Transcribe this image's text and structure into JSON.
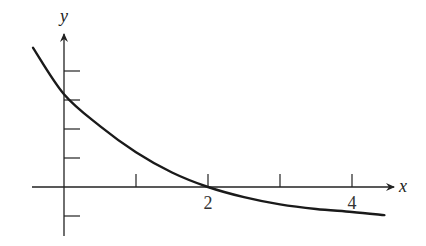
{
  "chart_data": {
    "type": "line",
    "title": "",
    "xlabel": "x",
    "ylabel": "y",
    "x_tick_labels": [
      {
        "value": 2,
        "label": "2"
      },
      {
        "value": 4,
        "label": "4"
      }
    ],
    "x_ticks": [
      1,
      2,
      3,
      4
    ],
    "y_ticks": [
      -1,
      1,
      2,
      3,
      4
    ],
    "y_tick_labels": [],
    "xlim": [
      -0.45,
      4.6
    ],
    "ylim": [
      -1.7,
      5.5
    ],
    "grid": false,
    "legend": null,
    "series": [
      {
        "name": "curve",
        "description": "decreasing convex curve crossing y-axis near 3.2 and x-axis at 2, approaching ~-1.2",
        "points": [
          [
            -0.43,
            4.8
          ],
          [
            0,
            3.2
          ],
          [
            0.5,
            2.1
          ],
          [
            1,
            1.2
          ],
          [
            1.5,
            0.5
          ],
          [
            2,
            0
          ],
          [
            2.5,
            -0.35
          ],
          [
            3,
            -0.6
          ],
          [
            3.5,
            -0.76
          ],
          [
            4,
            -0.86
          ],
          [
            4.45,
            -0.97
          ]
        ]
      }
    ]
  }
}
